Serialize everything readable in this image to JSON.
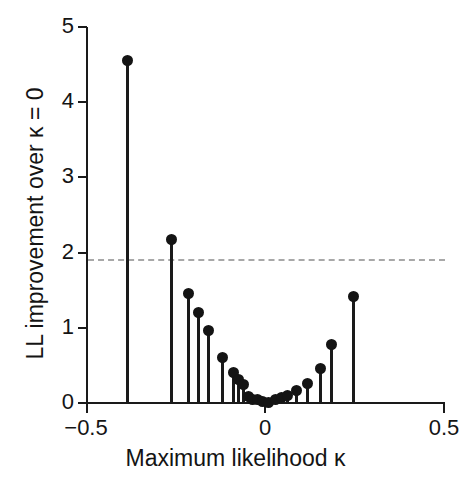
{
  "chart_data": {
    "type": "scatter",
    "plot_style": "stem",
    "title": "",
    "xlabel": "Maximum likelihood κ",
    "ylabel": "LL improvement over κ = 0",
    "xlim": [
      -0.5,
      0.5
    ],
    "ylim": [
      0,
      5
    ],
    "xticks": [
      -0.5,
      0,
      0.5
    ],
    "xticklabels": [
      "−0.5",
      "0",
      "0.5"
    ],
    "yticks": [
      0,
      1,
      2,
      3,
      4,
      5
    ],
    "yticklabels": [
      "0",
      "1",
      "2",
      "3",
      "4",
      "5"
    ],
    "grid": false,
    "legend": null,
    "annotations": [
      {
        "name": "significance-threshold",
        "type": "hline",
        "y": 1.92,
        "style": "dashed",
        "color": "#a8a8a8",
        "label": ""
      }
    ],
    "marker_color": "#141414",
    "stem_color": "#1a1a1a",
    "x": [
      -0.383,
      -0.26,
      -0.215,
      -0.187,
      -0.159,
      -0.12,
      -0.089,
      -0.075,
      -0.059,
      -0.045,
      -0.034,
      -0.022,
      -0.006,
      0.011,
      0.028,
      0.045,
      0.062,
      0.087,
      0.12,
      0.154,
      0.187,
      0.246
    ],
    "y": [
      4.55,
      2.18,
      1.46,
      1.21,
      0.96,
      0.61,
      0.41,
      0.31,
      0.24,
      0.08,
      0.05,
      0.04,
      0.02,
      0.01,
      0.05,
      0.07,
      0.1,
      0.17,
      0.26,
      0.46,
      0.78,
      1.41
    ],
    "values": [
      {
        "kappa": -0.383,
        "ll": 4.55
      },
      {
        "kappa": -0.26,
        "ll": 2.18
      },
      {
        "kappa": -0.215,
        "ll": 1.46
      },
      {
        "kappa": -0.187,
        "ll": 1.21
      },
      {
        "kappa": -0.159,
        "ll": 0.96
      },
      {
        "kappa": -0.12,
        "ll": 0.61
      },
      {
        "kappa": -0.089,
        "ll": 0.41
      },
      {
        "kappa": -0.075,
        "ll": 0.31
      },
      {
        "kappa": -0.059,
        "ll": 0.24
      },
      {
        "kappa": -0.045,
        "ll": 0.08
      },
      {
        "kappa": -0.034,
        "ll": 0.05
      },
      {
        "kappa": -0.022,
        "ll": 0.04
      },
      {
        "kappa": -0.006,
        "ll": 0.02
      },
      {
        "kappa": 0.011,
        "ll": 0.01
      },
      {
        "kappa": 0.028,
        "ll": 0.05
      },
      {
        "kappa": 0.045,
        "ll": 0.07
      },
      {
        "kappa": 0.062,
        "ll": 0.1
      },
      {
        "kappa": 0.087,
        "ll": 0.17
      },
      {
        "kappa": 0.12,
        "ll": 0.26
      },
      {
        "kappa": 0.154,
        "ll": 0.46
      },
      {
        "kappa": 0.187,
        "ll": 0.78
      },
      {
        "kappa": 0.246,
        "ll": 1.41
      }
    ]
  }
}
